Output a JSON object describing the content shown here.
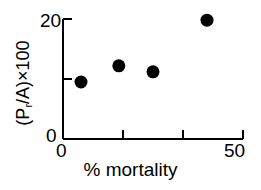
{
  "chart_data": {
    "type": "scatter",
    "title": "",
    "xlabel": "% mortality",
    "ylabel": "(Pr/A)×100",
    "ylabel_parts": {
      "open_paren": "(",
      "p_main": "P",
      "p_sub": "r",
      "slash_a": "/A)",
      "times_100": "×100"
    },
    "xlim": [
      0,
      50
    ],
    "ylim": [
      0,
      20
    ],
    "xticks": [
      0,
      50
    ],
    "xtick_labels": [
      "0",
      "50"
    ],
    "x_minor_ticks": [
      16.7,
      33.3
    ],
    "yticks": [
      0,
      20
    ],
    "ytick_labels": [
      "0",
      "20"
    ],
    "y_minor_ticks": [
      10
    ],
    "grid": false,
    "legend": null,
    "marker": "filled-circle",
    "marker_color": "#000000",
    "marker_size_px": 13,
    "axis_color": "#000000",
    "background": "#ffffff",
    "x": [
      5,
      15.5,
      25,
      40
    ],
    "y": [
      9.5,
      12.2,
      11.2,
      19.8
    ],
    "points": [
      {
        "x": 5,
        "y": 9.5
      },
      {
        "x": 15.5,
        "y": 12.2
      },
      {
        "x": 25,
        "y": 11.2
      },
      {
        "x": 40,
        "y": 19.8
      }
    ]
  },
  "axes": {
    "x_tick_0": "0",
    "x_tick_50": "50",
    "y_tick_0": "0",
    "y_tick_20": "20",
    "x_title": "% mortality"
  }
}
